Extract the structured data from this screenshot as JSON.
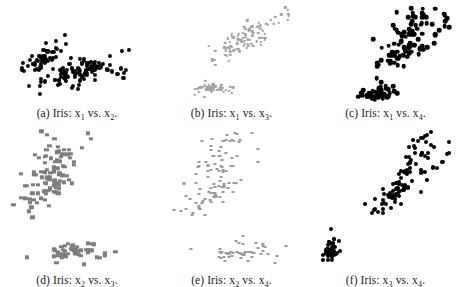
{
  "figure": {
    "background_color": "#ffffff",
    "grid_rows": 2,
    "grid_cols": 3
  },
  "panels": [
    {
      "id": "a",
      "label": "(a)",
      "dataset": "Iris",
      "caption_prefix": "(a) Iris: ",
      "caption_x": "x",
      "caption_xsub": "1",
      "caption_vs": " vs. ",
      "caption_y": "x",
      "caption_ysub": "2",
      "caption_end": ".",
      "caption_full": "(a) Iris: x1 vs. x2.",
      "marker_style": "m-round-dark",
      "marker_color": "#050505",
      "marker_shape": "circle"
    },
    {
      "id": "b",
      "label": "(b)",
      "dataset": "Iris",
      "caption_prefix": "(b) Iris: ",
      "caption_x": "x",
      "caption_xsub": "1",
      "caption_vs": " vs. ",
      "caption_y": "x",
      "caption_ysub": "3",
      "caption_end": ".",
      "caption_full": "(b) Iris: x1 vs. x3.",
      "marker_style": "m-small-light",
      "marker_color": "#a2a2a2",
      "marker_shape": "square"
    },
    {
      "id": "c",
      "label": "(c)",
      "dataset": "Iris",
      "caption_prefix": "(c) Iris: ",
      "caption_x": "x",
      "caption_xsub": "1",
      "caption_vs": " vs. ",
      "caption_y": "x",
      "caption_ysub": "4",
      "caption_end": ".",
      "caption_full": "(c) Iris: x1 vs. x4.",
      "marker_style": "m-round-black",
      "marker_color": "#000000",
      "marker_shape": "circle"
    },
    {
      "id": "d",
      "label": "(d)",
      "dataset": "Iris",
      "caption_prefix": "(d) Iris: ",
      "caption_x": "x",
      "caption_xsub": "2",
      "caption_vs": " vs. ",
      "caption_y": "x",
      "caption_ysub": "3",
      "caption_end": ".",
      "caption_full": "(d) Iris: x2 vs. x3.",
      "marker_style": "m-square-gray",
      "marker_color": "#7d7d7d",
      "marker_shape": "square"
    },
    {
      "id": "e",
      "label": "(e)",
      "dataset": "Iris",
      "caption_prefix": "(e) Iris: ",
      "caption_x": "x",
      "caption_xsub": "2",
      "caption_vs": " vs. ",
      "caption_y": "x",
      "caption_ysub": "4",
      "caption_end": ".",
      "caption_full": "(e) Iris: x2 vs. x4.",
      "marker_style": "m-dash-light",
      "marker_color": "#9a9a9a",
      "marker_shape": "square"
    },
    {
      "id": "f",
      "label": "(f)",
      "dataset": "Iris",
      "caption_prefix": "(f) Iris: ",
      "caption_x": "x",
      "caption_xsub": "3",
      "caption_vs": " vs. ",
      "caption_y": "x",
      "caption_ysub": "4",
      "caption_end": ".",
      "caption_full": "(f) Iris: x3 vs. x4.",
      "marker_style": "m-round-black-sm",
      "marker_color": "#000000",
      "marker_shape": "circle"
    }
  ],
  "chart_data": [
    {
      "type": "scatter",
      "panel": "a",
      "title": "(a) Iris: x1 vs. x2.",
      "xlabel": "x1",
      "ylabel": "x2",
      "xlim": [
        4.0,
        8.2
      ],
      "ylim": [
        1.8,
        4.6
      ],
      "grid": false,
      "legend": "none",
      "point_color": "#050505",
      "x": [
        5.1,
        4.9,
        4.7,
        4.6,
        5.0,
        5.4,
        4.6,
        5.0,
        4.4,
        4.9,
        5.4,
        4.8,
        4.8,
        4.3,
        5.8,
        5.7,
        5.4,
        5.1,
        5.7,
        5.1,
        5.4,
        5.1,
        4.6,
        5.1,
        4.8,
        5.0,
        5.0,
        5.2,
        5.2,
        4.7,
        4.8,
        5.4,
        5.2,
        5.5,
        4.9,
        5.0,
        5.5,
        4.9,
        4.4,
        5.1,
        5.0,
        4.5,
        4.4,
        5.0,
        5.1,
        4.8,
        5.1,
        4.6,
        5.3,
        5.0,
        7.0,
        6.4,
        6.9,
        5.5,
        6.5,
        5.7,
        6.3,
        4.9,
        6.6,
        5.2,
        5.0,
        5.9,
        6.0,
        6.1,
        5.6,
        6.7,
        5.6,
        5.8,
        6.2,
        5.6,
        5.9,
        6.1,
        6.3,
        6.1,
        6.4,
        6.6,
        6.8,
        6.7,
        6.0,
        5.7,
        5.5,
        5.5,
        5.8,
        6.0,
        5.4,
        6.0,
        6.7,
        6.3,
        5.6,
        5.5,
        5.5,
        6.1,
        5.8,
        5.0,
        5.6,
        5.7,
        5.7,
        6.2,
        5.1,
        5.7,
        6.3,
        5.8,
        7.1,
        6.3,
        6.5,
        7.6,
        4.9,
        7.3,
        6.7,
        7.2,
        6.5,
        6.4,
        6.8,
        5.7,
        5.8,
        6.4,
        6.5,
        7.7,
        7.7,
        6.0,
        6.9,
        5.6,
        7.7,
        6.3,
        6.7,
        7.2,
        6.2,
        6.1,
        6.4,
        7.2,
        7.4,
        7.9,
        6.4,
        6.3,
        6.1,
        7.7,
        6.3,
        6.4,
        6.0,
        6.9,
        6.7,
        6.9,
        5.8,
        6.8,
        6.7,
        6.7,
        6.3,
        6.5,
        6.2,
        5.9
      ],
      "y": [
        3.5,
        3.0,
        3.2,
        3.1,
        3.6,
        3.9,
        3.4,
        3.4,
        2.9,
        3.1,
        3.7,
        3.4,
        3.0,
        3.0,
        4.0,
        4.4,
        3.9,
        3.5,
        3.8,
        3.8,
        3.4,
        3.7,
        3.6,
        3.3,
        3.4,
        3.0,
        3.4,
        3.5,
        3.4,
        3.2,
        3.1,
        3.4,
        4.1,
        4.2,
        3.1,
        3.2,
        3.5,
        3.6,
        3.0,
        3.4,
        3.5,
        2.3,
        3.2,
        3.5,
        3.8,
        3.0,
        3.8,
        3.2,
        3.7,
        3.3,
        3.2,
        3.2,
        3.1,
        2.3,
        2.8,
        2.8,
        3.3,
        2.4,
        2.9,
        2.7,
        2.0,
        3.0,
        2.2,
        2.9,
        2.9,
        3.1,
        3.0,
        2.7,
        2.2,
        2.5,
        3.2,
        2.8,
        2.5,
        2.8,
        2.9,
        3.0,
        2.8,
        3.0,
        2.9,
        2.6,
        2.4,
        2.4,
        2.7,
        2.7,
        3.0,
        3.4,
        3.1,
        2.3,
        3.0,
        2.5,
        2.6,
        3.0,
        2.6,
        2.3,
        2.7,
        3.0,
        2.9,
        2.9,
        2.5,
        2.8,
        3.3,
        2.7,
        3.0,
        2.9,
        3.0,
        3.0,
        2.5,
        2.9,
        2.5,
        3.6,
        3.2,
        2.7,
        3.0,
        2.5,
        2.8,
        3.2,
        3.0,
        3.8,
        2.6,
        2.2,
        3.2,
        2.8,
        2.8,
        2.7,
        3.3,
        3.2,
        2.8,
        3.0,
        2.8,
        3.0,
        2.8,
        3.8,
        2.8,
        2.8,
        2.6,
        3.0,
        3.4,
        3.1,
        3.0,
        3.1,
        3.1,
        3.1,
        2.7,
        3.2,
        3.3,
        3.0,
        2.5,
        3.0,
        3.4,
        3.0
      ]
    },
    {
      "type": "scatter",
      "panel": "b",
      "title": "(b) Iris: x1 vs. x3.",
      "xlabel": "x1",
      "ylabel": "x3",
      "xlim": [
        4.0,
        8.2
      ],
      "ylim": [
        0.8,
        7.2
      ],
      "grid": false,
      "legend": "none",
      "point_color": "#a2a2a2"
    },
    {
      "type": "scatter",
      "panel": "c",
      "title": "(c) Iris: x1 vs. x4.",
      "xlabel": "x1",
      "ylabel": "x4",
      "xlim": [
        4.0,
        8.2
      ],
      "ylim": [
        0.0,
        2.7
      ],
      "grid": false,
      "legend": "none",
      "point_color": "#000000"
    },
    {
      "type": "scatter",
      "panel": "d",
      "title": "(d) Iris: x2 vs. x3.",
      "xlabel": "x2",
      "ylabel": "x3",
      "xlim": [
        1.8,
        4.6
      ],
      "ylim": [
        0.8,
        7.2
      ],
      "grid": false,
      "legend": "none",
      "point_color": "#7d7d7d"
    },
    {
      "type": "scatter",
      "panel": "e",
      "title": "(e) Iris: x2 vs. x4.",
      "xlabel": "x2",
      "ylabel": "x4",
      "xlim": [
        1.8,
        4.6
      ],
      "ylim": [
        0.0,
        2.7
      ],
      "grid": false,
      "legend": "none",
      "point_color": "#9a9a9a"
    },
    {
      "type": "scatter",
      "panel": "f",
      "title": "(f) Iris: x3 vs. x4.",
      "xlabel": "x3",
      "ylabel": "x4",
      "xlim": [
        0.8,
        7.2
      ],
      "ylim": [
        0.0,
        2.7
      ],
      "grid": false,
      "legend": "none",
      "point_color": "#000000"
    }
  ],
  "iris": {
    "sepal_length": [
      5.1,
      4.9,
      4.7,
      4.6,
      5.0,
      5.4,
      4.6,
      5.0,
      4.4,
      4.9,
      5.4,
      4.8,
      4.8,
      4.3,
      5.8,
      5.7,
      5.4,
      5.1,
      5.7,
      5.1,
      5.4,
      5.1,
      4.6,
      5.1,
      4.8,
      5.0,
      5.0,
      5.2,
      5.2,
      4.7,
      4.8,
      5.4,
      5.2,
      5.5,
      4.9,
      5.0,
      5.5,
      4.9,
      4.4,
      5.1,
      5.0,
      4.5,
      4.4,
      5.0,
      5.1,
      4.8,
      5.1,
      4.6,
      5.3,
      5.0,
      7.0,
      6.4,
      6.9,
      5.5,
      6.5,
      5.7,
      6.3,
      4.9,
      6.6,
      5.2,
      5.0,
      5.9,
      6.0,
      6.1,
      5.6,
      6.7,
      5.6,
      5.8,
      6.2,
      5.6,
      5.9,
      6.1,
      6.3,
      6.1,
      6.4,
      6.6,
      6.8,
      6.7,
      6.0,
      5.7,
      5.5,
      5.5,
      5.8,
      6.0,
      5.4,
      6.0,
      6.7,
      6.3,
      5.6,
      5.5,
      5.5,
      6.1,
      5.8,
      5.0,
      5.6,
      5.7,
      5.7,
      6.2,
      5.1,
      5.7,
      6.3,
      5.8,
      7.1,
      6.3,
      6.5,
      7.6,
      4.9,
      7.3,
      6.7,
      7.2,
      6.5,
      6.4,
      6.8,
      5.7,
      5.8,
      6.4,
      6.5,
      7.7,
      7.7,
      6.0,
      6.9,
      5.6,
      7.7,
      6.3,
      6.7,
      7.2,
      6.2,
      6.1,
      6.4,
      7.2,
      7.4,
      7.9,
      6.4,
      6.3,
      6.1,
      7.7,
      6.3,
      6.4,
      6.0,
      6.9,
      6.7,
      6.9,
      5.8,
      6.8,
      6.7,
      6.7,
      6.3,
      6.5,
      6.2,
      5.9
    ],
    "sepal_width": [
      3.5,
      3.0,
      3.2,
      3.1,
      3.6,
      3.9,
      3.4,
      3.4,
      2.9,
      3.1,
      3.7,
      3.4,
      3.0,
      3.0,
      4.0,
      4.4,
      3.9,
      3.5,
      3.8,
      3.8,
      3.4,
      3.7,
      3.6,
      3.3,
      3.4,
      3.0,
      3.4,
      3.5,
      3.4,
      3.2,
      3.1,
      3.4,
      4.1,
      4.2,
      3.1,
      3.2,
      3.5,
      3.6,
      3.0,
      3.4,
      3.5,
      2.3,
      3.2,
      3.5,
      3.8,
      3.0,
      3.8,
      3.2,
      3.7,
      3.3,
      3.2,
      3.2,
      3.1,
      2.3,
      2.8,
      2.8,
      3.3,
      2.4,
      2.9,
      2.7,
      2.0,
      3.0,
      2.2,
      2.9,
      2.9,
      3.1,
      3.0,
      2.7,
      2.2,
      2.5,
      3.2,
      2.8,
      2.5,
      2.8,
      2.9,
      3.0,
      2.8,
      3.0,
      2.9,
      2.6,
      2.4,
      2.4,
      2.7,
      2.7,
      3.0,
      3.4,
      3.1,
      2.3,
      3.0,
      2.5,
      2.6,
      3.0,
      2.6,
      2.3,
      2.7,
      3.0,
      2.9,
      2.9,
      2.5,
      2.8,
      3.3,
      2.7,
      3.0,
      2.9,
      3.0,
      3.0,
      2.5,
      2.9,
      2.5,
      3.6,
      3.2,
      2.7,
      3.0,
      2.5,
      2.8,
      3.2,
      3.0,
      3.8,
      2.6,
      2.2,
      3.2,
      2.8,
      2.8,
      2.7,
      3.3,
      3.2,
      2.8,
      3.0,
      2.8,
      3.0,
      2.8,
      3.8,
      2.8,
      2.8,
      2.6,
      3.0,
      3.4,
      3.1,
      3.0,
      3.1,
      3.1,
      3.1,
      2.7,
      3.2,
      3.3,
      3.0,
      2.5,
      3.0,
      3.4,
      3.0
    ],
    "petal_length": [
      1.4,
      1.4,
      1.3,
      1.5,
      1.4,
      1.7,
      1.4,
      1.5,
      1.4,
      1.5,
      1.5,
      1.6,
      1.4,
      1.1,
      1.2,
      1.5,
      1.3,
      1.4,
      1.7,
      1.5,
      1.7,
      1.5,
      1.0,
      1.7,
      1.9,
      1.6,
      1.6,
      1.5,
      1.4,
      1.6,
      1.6,
      1.5,
      1.5,
      1.4,
      1.5,
      1.2,
      1.3,
      1.4,
      1.3,
      1.5,
      1.3,
      1.3,
      1.3,
      1.6,
      1.9,
      1.4,
      1.6,
      1.4,
      1.5,
      1.4,
      4.7,
      4.5,
      4.9,
      4.0,
      4.6,
      4.5,
      4.7,
      3.3,
      4.6,
      3.9,
      3.5,
      4.2,
      4.0,
      4.7,
      3.6,
      4.4,
      4.5,
      4.1,
      4.5,
      3.9,
      4.8,
      4.0,
      4.9,
      4.7,
      4.3,
      4.4,
      4.8,
      5.0,
      4.5,
      3.5,
      3.8,
      3.7,
      3.9,
      5.1,
      4.5,
      4.5,
      4.7,
      4.4,
      4.1,
      4.0,
      4.4,
      4.6,
      4.0,
      3.3,
      4.2,
      4.2,
      4.2,
      4.3,
      3.0,
      4.1,
      6.0,
      5.1,
      5.9,
      5.6,
      5.8,
      6.6,
      4.5,
      6.3,
      5.8,
      6.1,
      5.1,
      5.3,
      5.5,
      5.0,
      5.1,
      5.3,
      5.5,
      6.7,
      6.9,
      5.0,
      5.7,
      4.9,
      6.7,
      4.9,
      5.7,
      6.0,
      4.8,
      4.9,
      5.6,
      5.8,
      6.1,
      6.4,
      5.6,
      5.1,
      5.6,
      6.1,
      5.6,
      5.5,
      4.8,
      5.4,
      5.6,
      5.1,
      5.1,
      5.9,
      5.7,
      5.2,
      5.0,
      5.2,
      5.4,
      5.1
    ],
    "petal_width": [
      0.2,
      0.2,
      0.2,
      0.2,
      0.2,
      0.4,
      0.3,
      0.2,
      0.2,
      0.1,
      0.2,
      0.2,
      0.1,
      0.1,
      0.2,
      0.4,
      0.4,
      0.3,
      0.3,
      0.3,
      0.2,
      0.4,
      0.2,
      0.5,
      0.2,
      0.2,
      0.4,
      0.2,
      0.2,
      0.2,
      0.2,
      0.4,
      0.1,
      0.2,
      0.2,
      0.2,
      0.2,
      0.1,
      0.2,
      0.2,
      0.3,
      0.3,
      0.2,
      0.6,
      0.4,
      0.3,
      0.2,
      0.2,
      0.2,
      0.2,
      1.4,
      1.5,
      1.5,
      1.3,
      1.5,
      1.3,
      1.6,
      1.0,
      1.3,
      1.4,
      1.0,
      1.5,
      1.0,
      1.4,
      1.3,
      1.4,
      1.5,
      1.0,
      1.5,
      1.1,
      1.8,
      1.3,
      1.5,
      1.2,
      1.3,
      1.4,
      1.4,
      1.7,
      1.5,
      1.0,
      1.1,
      1.0,
      1.2,
      1.6,
      1.5,
      1.6,
      1.5,
      1.3,
      1.3,
      1.3,
      1.2,
      1.4,
      1.2,
      1.0,
      1.3,
      1.2,
      1.3,
      1.3,
      1.1,
      1.3,
      2.5,
      1.9,
      2.1,
      1.8,
      2.2,
      2.1,
      1.7,
      1.8,
      1.8,
      2.5,
      2.0,
      1.9,
      2.1,
      2.0,
      2.4,
      2.3,
      1.8,
      2.2,
      2.3,
      1.5,
      2.3,
      2.0,
      2.0,
      1.8,
      2.1,
      1.8,
      1.8,
      1.8,
      2.1,
      1.6,
      1.9,
      2.0,
      2.2,
      1.5,
      1.4,
      2.3,
      2.4,
      1.8,
      1.8,
      2.1,
      2.4,
      2.3,
      1.9,
      2.3,
      2.5,
      2.3,
      1.9,
      2.0,
      2.3,
      1.8
    ]
  }
}
